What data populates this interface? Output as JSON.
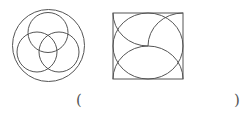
{
  "figures": [
    {
      "name": "circle-with-three-circles",
      "outer_circle": {
        "cx": 48.5,
        "cy": 45.5,
        "r": 36
      },
      "inner_circles": [
        {
          "cx": 48,
          "cy": 32.5,
          "r": 20
        },
        {
          "cx": 37,
          "cy": 52,
          "r": 20
        },
        {
          "cx": 59,
          "cy": 52,
          "r": 20
        }
      ]
    },
    {
      "name": "square-with-pinwheel-arcs",
      "square": {
        "x": 113,
        "y": 13,
        "w": 70,
        "h": 66
      },
      "inscribed_ellipse": {
        "cx": 148,
        "cy": 46,
        "rx": 35,
        "ry": 33
      }
    }
  ],
  "answer": {
    "open_paren": "(",
    "close_paren": ")",
    "blank": ""
  },
  "colors": {
    "stroke": "#555555",
    "background": "#ffffff"
  }
}
